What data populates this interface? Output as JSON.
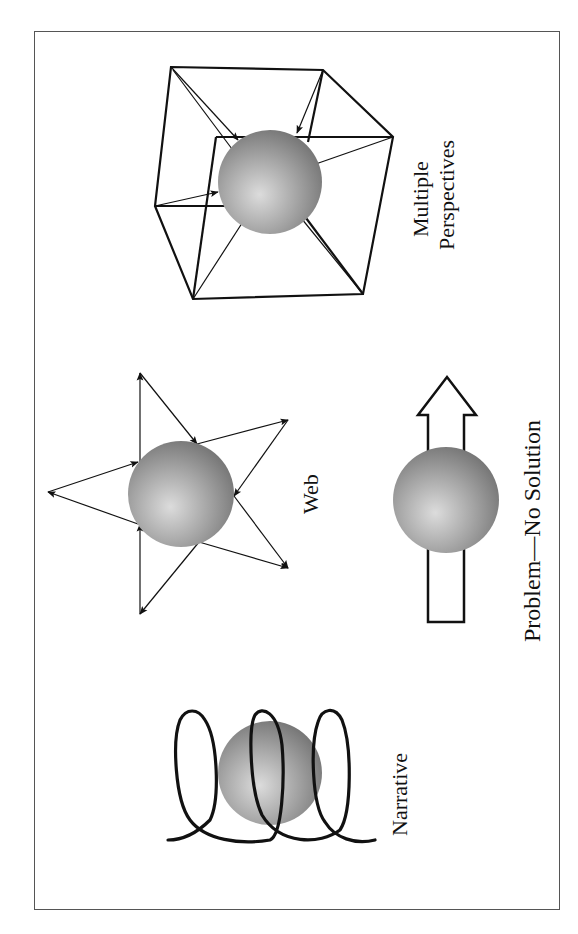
{
  "diagram": {
    "orientation": "rotated-90-counterclockwise",
    "panels": [
      {
        "id": "multiple-perspectives",
        "label_line1": "Multiple",
        "label_line2": "Perspectives",
        "shape": "sphere-in-cube-with-inward-arrows"
      },
      {
        "id": "web",
        "label": "Web",
        "shape": "sphere-with-star-of-bidirectional-arrows"
      },
      {
        "id": "problem-no-solution",
        "label": "Problem—No Solution",
        "shape": "sphere-on-hollow-arrow"
      },
      {
        "id": "narrative",
        "label": "Narrative",
        "shape": "sphere-wrapped-in-helix"
      }
    ],
    "colors": {
      "sphere_light": "#d8d8d8",
      "sphere_dark": "#7a7a7a",
      "stroke": "#111111",
      "frame": "#555555",
      "background": "#ffffff"
    }
  }
}
